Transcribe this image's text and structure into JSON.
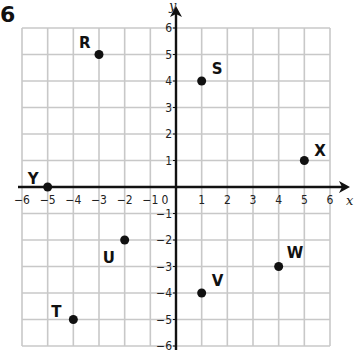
{
  "problem_number": "6",
  "chart_data": {
    "type": "scatter",
    "title": "",
    "xlabel": "x",
    "ylabel": "y",
    "xlim": [
      -6,
      6
    ],
    "ylim": [
      -6,
      6
    ],
    "grid": true,
    "x_ticks": [
      "-6",
      "-5",
      "-4",
      "-3",
      "-2",
      "-1",
      "1",
      "2",
      "3",
      "4",
      "5",
      "6"
    ],
    "y_ticks": [
      "6",
      "5",
      "4",
      "3",
      "2",
      "1",
      "-1",
      "-2",
      "-3",
      "-4",
      "-5",
      "-6"
    ],
    "origin_label": "0",
    "points": [
      {
        "label": "R",
        "x": -3,
        "y": 5
      },
      {
        "label": "S",
        "x": 1,
        "y": 4
      },
      {
        "label": "X",
        "x": 5,
        "y": 1
      },
      {
        "label": "Y",
        "x": -5,
        "y": 0
      },
      {
        "label": "U",
        "x": -2,
        "y": -2
      },
      {
        "label": "W",
        "x": 4,
        "y": -3
      },
      {
        "label": "V",
        "x": 1,
        "y": -4
      },
      {
        "label": "T",
        "x": -4,
        "y": -5
      }
    ]
  },
  "colors": {
    "grid": "#c8c8c8",
    "axis": "#111111",
    "point": "#111111"
  }
}
